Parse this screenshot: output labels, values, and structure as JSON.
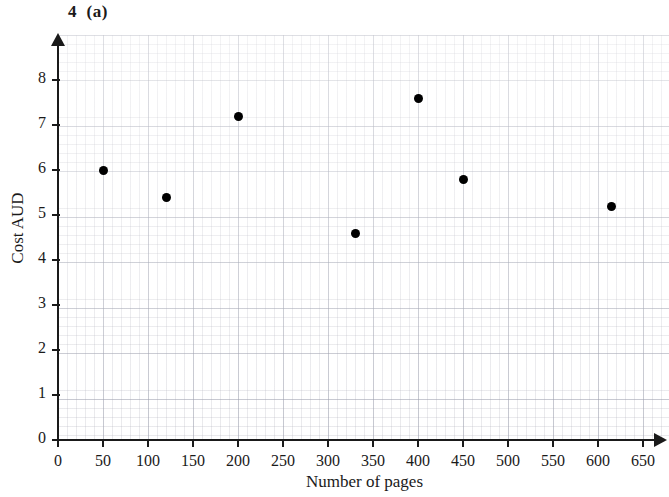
{
  "figure": {
    "title": "4  (a)"
  },
  "chart_data": {
    "type": "scatter",
    "title": "4  (a)",
    "xlabel": "Number of pages",
    "ylabel": "Cost AUD",
    "xlim": [
      0,
      670
    ],
    "ylim": [
      0,
      8.6
    ],
    "grid": true,
    "grid_style": "graph-paper",
    "legend": null,
    "x_ticks": [
      0,
      50,
      100,
      150,
      200,
      250,
      300,
      350,
      400,
      450,
      500,
      550,
      600,
      650
    ],
    "y_ticks": [
      0,
      1,
      2,
      3,
      4,
      5,
      6,
      7,
      8
    ],
    "marker": "filled-circle",
    "marker_color": "#000000",
    "points": [
      {
        "x": 50,
        "y": 6.0
      },
      {
        "x": 120,
        "y": 5.4
      },
      {
        "x": 200,
        "y": 7.2
      },
      {
        "x": 330,
        "y": 4.6
      },
      {
        "x": 400,
        "y": 7.6
      },
      {
        "x": 450,
        "y": 5.8
      },
      {
        "x": 615,
        "y": 5.2
      }
    ]
  },
  "colors": {
    "axis": "#1a1a1a",
    "marker": "#000000",
    "grid_minor": "#9696a5",
    "grid_major": "#787d91",
    "background": "#ffffff"
  }
}
